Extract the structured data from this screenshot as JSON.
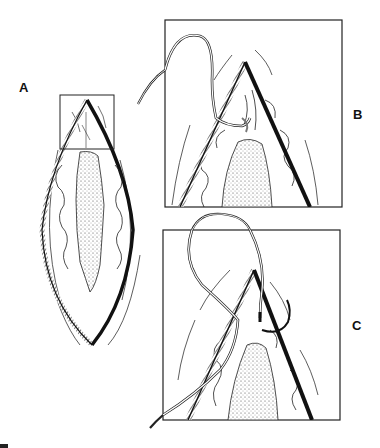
{
  "figure": {
    "panels": [
      {
        "id": "A",
        "label": "A",
        "content": "Elliptical open wound with boxed apex region"
      },
      {
        "id": "B",
        "label": "B",
        "content": "Magnified apex: suture passed through wound edge"
      },
      {
        "id": "C",
        "label": "C",
        "content": "Magnified apex: suture looped with curved needle"
      }
    ],
    "colors": {
      "ink": "#111111",
      "background": "#ffffff",
      "stipple": "#555555"
    }
  }
}
